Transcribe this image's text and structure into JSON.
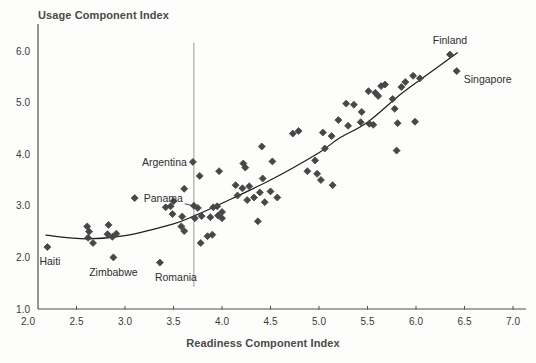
{
  "chart_data": {
    "type": "scatter",
    "title": "",
    "ylabel": "Usage Component Index",
    "xlabel": "Readiness Component Index",
    "xlim": [
      2.0,
      7.0
    ],
    "ylim": [
      1.0,
      6.0
    ],
    "grid": false,
    "legend": "none",
    "marker": "diamond",
    "colors": {
      "marker": "#474747",
      "trend_line": "#1f1f1f",
      "vertical_line": "#a3a3a3",
      "axis": "#4f4f4f",
      "tick_text": "#3a3a3a",
      "label_text": "#2e2e2e",
      "background": "#fdfdfb"
    },
    "x_ticks": [
      "2.0",
      "2.5",
      "3.0",
      "3.5",
      "4.0",
      "4.5",
      "5.0",
      "5.5",
      "6.0",
      "6.5",
      "7.0"
    ],
    "y_ticks": [
      "1.0",
      "2.0",
      "3.0",
      "4.0",
      "5.0",
      "6.0"
    ],
    "vertical_line": {
      "x": 3.71,
      "y_top": 6.16,
      "y_bottom": 1.43
    },
    "trend_line": [
      [
        2.18,
        2.43
      ],
      [
        2.6,
        2.36
      ],
      [
        3.0,
        2.42
      ],
      [
        3.5,
        2.65
      ],
      [
        3.72,
        2.81
      ],
      [
        4.0,
        3.05
      ],
      [
        4.5,
        3.5
      ],
      [
        5.0,
        4.03
      ],
      [
        5.2,
        4.3
      ],
      [
        5.5,
        4.62
      ],
      [
        5.84,
        5.16
      ],
      [
        6.1,
        5.52
      ],
      [
        6.43,
        5.97
      ]
    ],
    "points": [
      [
        2.61,
        2.6
      ],
      [
        2.63,
        2.5
      ],
      [
        2.62,
        2.38
      ],
      [
        2.67,
        2.28
      ],
      [
        2.83,
        2.63
      ],
      [
        2.82,
        2.45
      ],
      [
        2.87,
        2.4
      ],
      [
        2.91,
        2.46
      ],
      [
        3.1,
        3.15
      ],
      [
        3.42,
        2.97
      ],
      [
        3.47,
        2.99
      ],
      [
        3.5,
        3.09
      ],
      [
        3.49,
        2.84
      ],
      [
        3.58,
        2.6
      ],
      [
        3.61,
        2.51
      ],
      [
        3.59,
        2.79
      ],
      [
        3.61,
        3.33
      ],
      [
        3.75,
        2.96
      ],
      [
        3.72,
        2.76
      ],
      [
        3.79,
        2.8
      ],
      [
        3.77,
        3.58
      ],
      [
        3.85,
        2.41
      ],
      [
        3.9,
        2.44
      ],
      [
        3.78,
        2.28
      ],
      [
        3.88,
        2.78
      ],
      [
        3.91,
        2.97
      ],
      [
        3.95,
        2.99
      ],
      [
        3.96,
        2.81
      ],
      [
        3.97,
        3.67
      ],
      [
        4.0,
        2.88
      ],
      [
        4.0,
        2.76
      ],
      [
        4.14,
        3.4
      ],
      [
        4.16,
        3.2
      ],
      [
        4.21,
        3.34
      ],
      [
        4.28,
        3.38
      ],
      [
        4.26,
        3.11
      ],
      [
        4.33,
        3.16
      ],
      [
        4.39,
        3.26
      ],
      [
        4.44,
        3.07
      ],
      [
        4.37,
        2.7
      ],
      [
        4.5,
        3.28
      ],
      [
        4.57,
        3.16
      ],
      [
        4.22,
        3.82
      ],
      [
        4.24,
        3.74
      ],
      [
        4.41,
        4.15
      ],
      [
        4.52,
        3.86
      ],
      [
        4.42,
        3.53
      ],
      [
        4.73,
        4.4
      ],
      [
        4.79,
        4.45
      ],
      [
        4.88,
        3.67
      ],
      [
        4.96,
        3.88
      ],
      [
        4.98,
        3.62
      ],
      [
        5.02,
        3.5
      ],
      [
        5.04,
        4.42
      ],
      [
        5.06,
        4.11
      ],
      [
        5.13,
        4.35
      ],
      [
        5.14,
        3.4
      ],
      [
        5.2,
        4.66
      ],
      [
        5.28,
        4.98
      ],
      [
        5.3,
        4.55
      ],
      [
        5.36,
        4.96
      ],
      [
        5.44,
        4.82
      ],
      [
        5.43,
        4.62
      ],
      [
        5.52,
        4.59
      ],
      [
        5.56,
        4.57
      ],
      [
        5.51,
        5.22
      ],
      [
        5.58,
        5.19
      ],
      [
        5.61,
        5.13
      ],
      [
        5.64,
        5.32
      ],
      [
        5.68,
        5.35
      ],
      [
        5.76,
        5.07
      ],
      [
        5.78,
        4.88
      ],
      [
        5.81,
        4.6
      ],
      [
        5.8,
        4.07
      ],
      [
        5.85,
        5.3
      ],
      [
        5.89,
        5.4
      ],
      [
        5.97,
        5.52
      ],
      [
        5.99,
        4.63
      ],
      [
        6.04,
        5.47
      ]
    ],
    "labeled_points": [
      {
        "name": "Haiti",
        "x": 2.2,
        "y": 2.2,
        "anchor": "start",
        "dx": -8,
        "dy": 18
      },
      {
        "name": "Zimbabwe",
        "x": 2.88,
        "y": 2.0,
        "anchor": "middle",
        "dx": 0,
        "dy": 19
      },
      {
        "name": "Romania",
        "x": 3.36,
        "y": 1.9,
        "anchor": "start",
        "dx": -5,
        "dy": 18
      },
      {
        "name": "Argentina",
        "x": 3.7,
        "y": 3.85,
        "anchor": "end",
        "dx": -6,
        "dy": 4
      },
      {
        "name": "Panama",
        "x": 3.71,
        "y": 3.0,
        "anchor": "end",
        "dx": -11,
        "dy": -4,
        "connector": true
      },
      {
        "name": "Finland",
        "x": 6.35,
        "y": 5.93,
        "anchor": "middle",
        "dx": 0,
        "dy": -11
      },
      {
        "name": "Singapore",
        "x": 6.42,
        "y": 5.61,
        "anchor": "start",
        "dx": 7,
        "dy": 12
      }
    ]
  }
}
